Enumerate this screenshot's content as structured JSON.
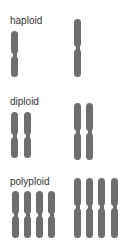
{
  "colors": {
    "chromosome": "#6e6e6e",
    "label": "#333333",
    "background": "#ffffff"
  },
  "groups": [
    {
      "label": "haploid",
      "label_y": 15,
      "small": {
        "top": 31,
        "height": 46,
        "centromere": 24,
        "xs": [
          11
        ]
      },
      "large": {
        "top": 19,
        "height": 58,
        "centromere": 29,
        "xs": [
          74
        ]
      }
    },
    {
      "label": "diploid",
      "label_y": 96,
      "small": {
        "top": 112,
        "height": 46,
        "centromere": 24,
        "xs": [
          11,
          24
        ]
      },
      "large": {
        "top": 103,
        "height": 57,
        "centromere": 29,
        "xs": [
          74,
          86
        ]
      }
    },
    {
      "label": "polyploid",
      "label_y": 176,
      "small": {
        "top": 191,
        "height": 47,
        "centromere": 24,
        "xs": [
          12,
          24,
          36,
          48
        ]
      },
      "large": {
        "top": 178,
        "height": 60,
        "centromere": 29,
        "xs": [
          74,
          86,
          98,
          111
        ]
      }
    }
  ]
}
